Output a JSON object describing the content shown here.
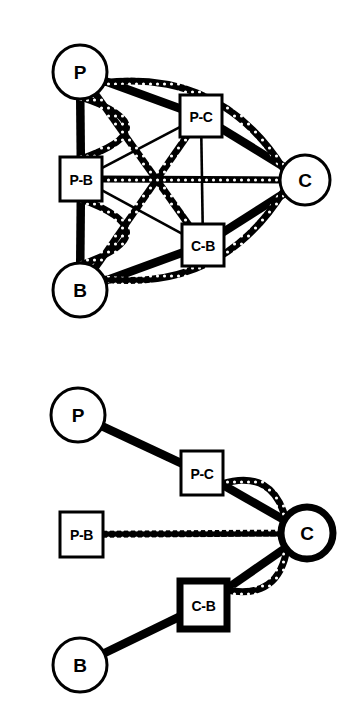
{
  "figure": {
    "background_color": "#ffffff",
    "line_color": "#000000",
    "node_fill": "#ffffff",
    "width": 358,
    "height": 703
  },
  "legend": {
    "edge_types": [
      {
        "name": "solid-edge",
        "style": "solid thick black line"
      },
      {
        "name": "textured-edge",
        "style": "beaded chain-like curved line"
      }
    ]
  },
  "panels": [
    {
      "id": "top-panel",
      "name": "complete-graph-panel",
      "nodes": [
        {
          "id": "P",
          "label": "P",
          "shape": "circle",
          "cx": 80,
          "cy": 72,
          "r": 27,
          "stroke_width": 3,
          "emphasis": "normal"
        },
        {
          "id": "PC",
          "label": "P-C",
          "shape": "square",
          "x": 180,
          "y": 95,
          "w": 42,
          "h": 42,
          "stroke_width": 3,
          "emphasis": "normal"
        },
        {
          "id": "C",
          "label": "C",
          "shape": "circle",
          "cx": 305,
          "cy": 180,
          "r": 25,
          "stroke_width": 3,
          "emphasis": "normal"
        },
        {
          "id": "PB",
          "label": "P-B",
          "shape": "square",
          "x": 60,
          "y": 157,
          "w": 42,
          "h": 44,
          "stroke_width": 3,
          "emphasis": "normal"
        },
        {
          "id": "CB",
          "label": "C-B",
          "shape": "square",
          "x": 182,
          "y": 224,
          "w": 42,
          "h": 42,
          "stroke_width": 3,
          "emphasis": "normal"
        },
        {
          "id": "B",
          "label": "B",
          "shape": "circle",
          "cx": 80,
          "cy": 290,
          "r": 27,
          "stroke_width": 3,
          "emphasis": "normal"
        }
      ],
      "edges": [
        {
          "from": "P",
          "to": "PB",
          "style": "solid",
          "weight": "thick",
          "curve": 0
        },
        {
          "from": "PB",
          "to": "B",
          "style": "solid",
          "weight": "thick",
          "curve": 0
        },
        {
          "from": "P",
          "to": "PC",
          "style": "solid",
          "weight": "thick",
          "curve": 0
        },
        {
          "from": "PC",
          "to": "C",
          "style": "solid",
          "weight": "thick",
          "curve": 0
        },
        {
          "from": "CB",
          "to": "C",
          "style": "solid",
          "weight": "thick",
          "curve": 0
        },
        {
          "from": "B",
          "to": "CB",
          "style": "solid",
          "weight": "thick",
          "curve": 0
        },
        {
          "from": "PC",
          "to": "CB",
          "style": "solid",
          "weight": "thin",
          "curve": 0
        },
        {
          "from": "PB",
          "to": "PC",
          "style": "solid",
          "weight": "thin",
          "curve": 0
        },
        {
          "from": "PB",
          "to": "CB",
          "style": "solid",
          "weight": "thin",
          "curve": 0
        },
        {
          "from": "PB",
          "to": "C",
          "style": "textured",
          "weight": "medium",
          "curve": 0
        },
        {
          "from": "P",
          "to": "PB",
          "style": "textured",
          "weight": "medium",
          "curve": -46
        },
        {
          "from": "PB",
          "to": "B",
          "style": "textured",
          "weight": "medium",
          "curve": -46
        },
        {
          "from": "P",
          "to": "C",
          "style": "textured",
          "weight": "medium",
          "curve": -32
        },
        {
          "from": "B",
          "to": "C",
          "style": "textured",
          "weight": "medium",
          "curve": 32
        },
        {
          "from": "P",
          "to": "CB",
          "style": "textured",
          "weight": "medium",
          "curve": 0
        },
        {
          "from": "B",
          "to": "PC",
          "style": "textured",
          "weight": "medium",
          "curve": 0
        }
      ]
    },
    {
      "id": "bottom-panel",
      "name": "star-graph-panel",
      "nodes": [
        {
          "id": "P",
          "label": "P",
          "shape": "circle",
          "cx": 78,
          "cy": 65,
          "r": 27,
          "stroke_width": 3,
          "emphasis": "normal"
        },
        {
          "id": "PC",
          "label": "P-C",
          "shape": "square",
          "x": 181,
          "y": 101,
          "w": 42,
          "h": 44,
          "stroke_width": 3,
          "emphasis": "normal"
        },
        {
          "id": "C",
          "label": "C",
          "shape": "circle",
          "cx": 307,
          "cy": 183,
          "r": 26,
          "stroke_width": 7,
          "emphasis": "bold"
        },
        {
          "id": "PB",
          "label": "P-B",
          "shape": "square",
          "x": 60,
          "y": 162,
          "w": 43,
          "h": 45,
          "stroke_width": 3,
          "emphasis": "normal"
        },
        {
          "id": "CB",
          "label": "C-B",
          "shape": "square",
          "x": 180,
          "y": 231,
          "w": 47,
          "h": 48,
          "stroke_width": 7,
          "emphasis": "bold"
        },
        {
          "id": "B",
          "label": "B",
          "shape": "circle",
          "cx": 80,
          "cy": 315,
          "r": 27,
          "stroke_width": 3,
          "emphasis": "normal"
        }
      ],
      "edges": [
        {
          "from": "P",
          "to": "PC",
          "style": "solid",
          "weight": "thick",
          "curve": 0
        },
        {
          "from": "PC",
          "to": "C",
          "style": "solid",
          "weight": "thick",
          "curve": 0
        },
        {
          "from": "PC",
          "to": "C",
          "style": "textured",
          "weight": "medium",
          "curve": -20
        },
        {
          "from": "PB",
          "to": "C",
          "style": "textured",
          "weight": "medium",
          "curve": 0
        },
        {
          "from": "CB",
          "to": "C",
          "style": "solid",
          "weight": "thick",
          "curve": 0
        },
        {
          "from": "CB",
          "to": "C",
          "style": "textured",
          "weight": "medium",
          "curve": 20
        },
        {
          "from": "B",
          "to": "CB",
          "style": "solid",
          "weight": "thick",
          "curve": 0
        }
      ]
    }
  ]
}
